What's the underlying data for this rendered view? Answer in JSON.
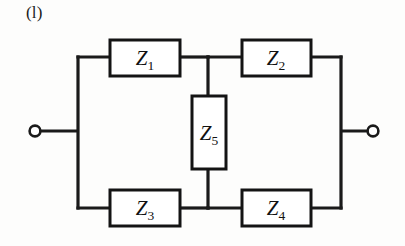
{
  "figure": {
    "caption": "(l)",
    "background_color": "#fdfdfc",
    "line_color": "#1a1a1a",
    "width": 405,
    "height": 246
  },
  "diagram": {
    "type": "circuit-schematic",
    "name": "bridge-network",
    "components": [
      {
        "id": "Z1",
        "symbol": "Z",
        "subscript": "1",
        "kind": "impedance",
        "orientation": "horizontal",
        "position": "top-left-branch",
        "box": {
          "x": 110,
          "y": 40,
          "w": 70,
          "h": 36
        },
        "label_x": 145,
        "label_y": 65
      },
      {
        "id": "Z2",
        "symbol": "Z",
        "subscript": "2",
        "kind": "impedance",
        "orientation": "horizontal",
        "position": "top-right-branch",
        "box": {
          "x": 242,
          "y": 40,
          "w": 69,
          "h": 36
        },
        "label_x": 276,
        "label_y": 65
      },
      {
        "id": "Z3",
        "symbol": "Z",
        "subscript": "3",
        "kind": "impedance",
        "orientation": "horizontal",
        "position": "bottom-left-branch",
        "box": {
          "x": 110,
          "y": 190,
          "w": 70,
          "h": 36
        },
        "label_x": 145,
        "label_y": 215
      },
      {
        "id": "Z4",
        "symbol": "Z",
        "subscript": "4",
        "kind": "impedance",
        "orientation": "horizontal",
        "position": "bottom-right-branch",
        "box": {
          "x": 242,
          "y": 190,
          "w": 69,
          "h": 36
        },
        "label_x": 276,
        "label_y": 215
      },
      {
        "id": "Z5",
        "symbol": "Z",
        "subscript": "5",
        "kind": "impedance",
        "orientation": "vertical",
        "position": "bridge-arm",
        "box": {
          "x": 192,
          "y": 96,
          "w": 34,
          "h": 73
        },
        "label_x": 209,
        "label_y": 140
      }
    ],
    "nodes": [
      {
        "id": "left-terminal",
        "x": 35,
        "y": 131,
        "r": 5.4,
        "type": "open-terminal"
      },
      {
        "id": "right-terminal",
        "x": 373,
        "y": 131,
        "r": 5.4,
        "type": "open-terminal"
      },
      {
        "id": "left-rail-node",
        "x": 78,
        "y": 131,
        "type": "junction"
      },
      {
        "id": "right-rail-node",
        "x": 341,
        "y": 131,
        "type": "junction"
      },
      {
        "id": "mid-top-node",
        "x": 208,
        "y": 57,
        "type": "junction"
      },
      {
        "id": "mid-bottom-node",
        "x": 208,
        "y": 208,
        "type": "junction"
      }
    ],
    "geometry": {
      "left_rail_x": 78,
      "right_rail_x": 341,
      "top_bus_y": 57,
      "bottom_bus_y": 208,
      "mid_x": 208,
      "terminal_y": 131
    }
  }
}
